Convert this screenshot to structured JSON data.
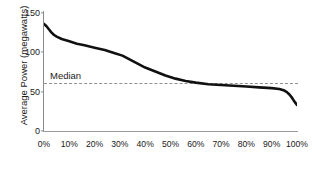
{
  "chart_data": {
    "type": "line",
    "title": "",
    "xlabel": "",
    "ylabel": "Average Power (megawatts)",
    "xlim": [
      0,
      100
    ],
    "ylim": [
      0,
      150
    ],
    "grid": false,
    "legend": null,
    "x_tick_labels": [
      "0%",
      "10%",
      "20%",
      "30%",
      "40%",
      "50%",
      "60%",
      "70%",
      "80%",
      "90%",
      "100%"
    ],
    "x_ticks": [
      0,
      10,
      20,
      30,
      40,
      50,
      60,
      70,
      80,
      90,
      100
    ],
    "y_tick_labels": [
      "0",
      "50",
      "100",
      "150"
    ],
    "y_ticks": [
      0,
      50,
      100,
      150
    ],
    "series": [
      {
        "name": "Average Power",
        "color": "#111111",
        "x": [
          0,
          1,
          2,
          3,
          4,
          5,
          7,
          10,
          13,
          16,
          20,
          24,
          28,
          31,
          34,
          37,
          40,
          44,
          48,
          52,
          56,
          60,
          65,
          70,
          75,
          80,
          85,
          90,
          93,
          95,
          96,
          97,
          98,
          99,
          100
        ],
        "values": [
          135,
          132,
          128,
          124,
          121,
          119,
          116,
          113,
          110,
          108,
          105,
          102,
          98,
          95,
          90,
          85,
          80,
          75,
          70,
          66,
          63,
          61,
          59,
          58,
          57,
          56,
          55,
          54,
          53,
          51,
          49,
          46,
          42,
          37,
          33
        ]
      }
    ],
    "annotations": [
      {
        "name": "median",
        "label": "Median",
        "value": 60,
        "style": "dashed-horizontal-line",
        "color": "#8e9294"
      }
    ]
  },
  "axis": {
    "axis_color": "#8c9092",
    "curve_color": "#111111"
  }
}
